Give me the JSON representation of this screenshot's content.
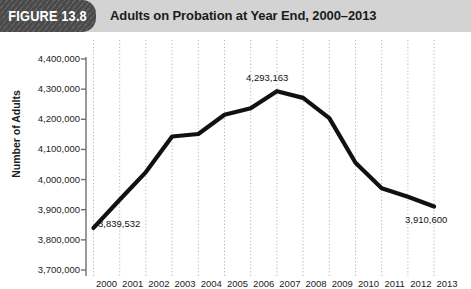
{
  "header": {
    "badge_label": "FIGURE 13.8",
    "title": "Adults on Probation at Year End, 2000–2013",
    "banner_color": "#d3d3d3",
    "badge_color": "#4a4a4a"
  },
  "chart_data": {
    "type": "line",
    "title": "Adults on Probation at Year End, 2000–2013",
    "xlabel": "",
    "ylabel": "Number of Adults",
    "grid": true,
    "legend": "none",
    "line_color": "#111111",
    "x": [
      2000,
      2001,
      2002,
      2003,
      2004,
      2005,
      2006,
      2007,
      2008,
      2009,
      2010,
      2011,
      2012,
      2013
    ],
    "categories": [
      "2000",
      "2001",
      "2002",
      "2003",
      "2004",
      "2005",
      "2006",
      "2007",
      "2008",
      "2009",
      "2010",
      "2011",
      "2012",
      "2013"
    ],
    "values": [
      3839532,
      3932751,
      4024830,
      4143048,
      4151125,
      4215361,
      4236800,
      4293163,
      4270917,
      4203967,
      4055514,
      3971319,
      3942800,
      3910600
    ],
    "ylim": [
      3700000,
      4400000
    ],
    "ytick_values": [
      4400000,
      4300000,
      4200000,
      4100000,
      4000000,
      3900000,
      3800000,
      3700000
    ],
    "ytick_labels": [
      "4,400,000",
      "4,300,000",
      "4,200,000",
      "4,100,000",
      "4,000,000",
      "3,900,000",
      "3,800,000",
      "3,700,000"
    ],
    "xtick_labels": [
      "2000",
      "2001",
      "2002",
      "2003",
      "2004",
      "2005",
      "2006",
      "2007",
      "2008",
      "2009",
      "2010",
      "2011",
      "2012",
      "2013"
    ],
    "annotations": [
      {
        "label": "3,839,532",
        "x": 2000,
        "y": 3839532
      },
      {
        "label": "4,293,163",
        "x": 2007,
        "y": 4293163
      },
      {
        "label": "3,910,600",
        "x": 2013,
        "y": 3910600
      }
    ]
  },
  "annotation_labels": {
    "first": "3,839,532",
    "peak": "4,293,163",
    "last": "3,910,600"
  }
}
